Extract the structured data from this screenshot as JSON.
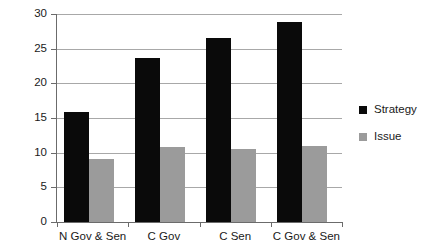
{
  "chart_data": {
    "type": "bar",
    "title": "",
    "xlabel": "",
    "ylabel": "",
    "categories": [
      "N Gov & Sen",
      "C Gov",
      "C Sen",
      "C Gov & Sen"
    ],
    "series": [
      {
        "name": "Strategy",
        "color": "#0a0a0a",
        "values": [
          15.8,
          23.7,
          26.6,
          28.8
        ]
      },
      {
        "name": "Issue",
        "color": "#9b9b9b",
        "values": [
          9.1,
          10.8,
          10.5,
          11.0
        ]
      }
    ],
    "ylim": [
      0,
      30
    ],
    "ytick_values": [
      0,
      5,
      10,
      15,
      20,
      25,
      30
    ],
    "ytick_labels": [
      "0",
      "5",
      "10",
      "15",
      "20",
      "25",
      "30"
    ],
    "grid": true,
    "grid_axis": "y",
    "legend_position": "right",
    "legend": [
      {
        "label": "Strategy",
        "swatch": "black-square"
      },
      {
        "label": "Issue",
        "swatch": "gray-square"
      }
    ]
  },
  "colors": {
    "strategy": "#0a0a0a",
    "issue": "#9b9b9b",
    "gridline": "#a8a8a8",
    "axis": "#6b6b6b",
    "text": "#1a1a1a",
    "background": "#ffffff"
  }
}
